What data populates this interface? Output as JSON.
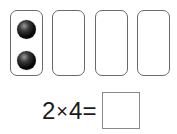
{
  "groups": [
    {
      "label": "group-1",
      "ball_count": 2
    },
    {
      "label": "group-2",
      "ball_count": 0
    },
    {
      "label": "group-3",
      "ball_count": 0
    },
    {
      "label": "group-4",
      "ball_count": 0
    }
  ],
  "equation": {
    "left_operand": "2",
    "operator": "×",
    "right_operand": "4",
    "equals": "=",
    "answer": ""
  },
  "colors": {
    "box_border": "#6a6a6a",
    "ball": "#000000",
    "text": "#1a1a1a"
  }
}
